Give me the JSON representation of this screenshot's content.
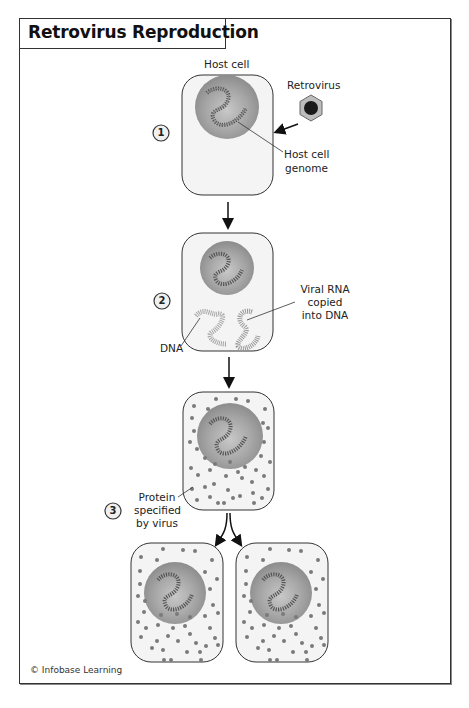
{
  "title": "Retrovirus Reproduction",
  "credit": "© Infobase Learning",
  "steps": [
    {
      "number": "1",
      "labels": {
        "host_cell": "Host cell",
        "retrovirus": "Retrovirus",
        "genome_line1": "Host cell",
        "genome_line2": "genome"
      }
    },
    {
      "number": "2",
      "labels": {
        "dna": "DNA",
        "viral_rna_line1": "Viral RNA",
        "viral_rna_line2": "copied",
        "viral_rna_line3": "into DNA"
      }
    },
    {
      "number": "3",
      "labels": {
        "protein_line1": "Protein",
        "protein_line2": "specified",
        "protein_line3": "by virus"
      }
    }
  ],
  "colors": {
    "cell_fill": "#f4f4f4",
    "cell_stroke": "#333333",
    "nucleus_fill": "#9a9a9a",
    "protein_dot": "#7a7a7a",
    "virus_dark": "#1a1a1a"
  }
}
